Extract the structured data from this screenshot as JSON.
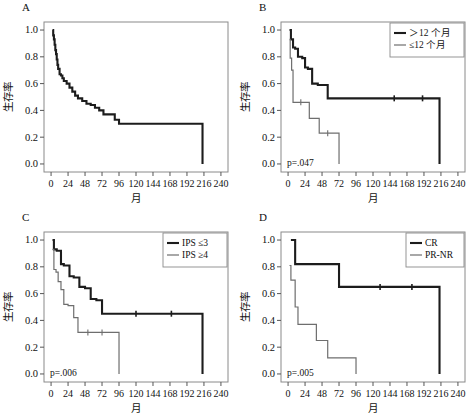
{
  "figure": {
    "axis": {
      "y_label": "生存率",
      "x_label": "月",
      "y_ticks": [
        "1.0",
        "0.8",
        "0.6",
        "0.4",
        "0.2",
        "0.0"
      ],
      "y_tick_values": [
        1.0,
        0.8,
        0.6,
        0.4,
        0.2,
        0.0
      ],
      "x_ticks": [
        "0",
        "24",
        "48",
        "72",
        "96",
        "120",
        "144",
        "168",
        "192",
        "216",
        "240"
      ],
      "x_tick_values": [
        0,
        24,
        48,
        72,
        96,
        120,
        144,
        168,
        192,
        216,
        240
      ],
      "xlim": [
        -10,
        250
      ],
      "ylim": [
        -0.06,
        1.06
      ],
      "grid": false
    },
    "colors": {
      "curve_thick": "#1c1c1c",
      "curve_thin": "#6e6e6e",
      "frame": "#8a8a8a",
      "text": "#111111",
      "background": "#ffffff"
    },
    "panels": [
      {
        "letter": "A",
        "pvalue": "",
        "legend": [],
        "legend_position": "none",
        "chart_data": {
          "type": "line",
          "title": "A",
          "xlabel": "月",
          "ylabel": "生存率",
          "xlim": [
            -10,
            250
          ],
          "ylim": [
            -0.06,
            1.06
          ],
          "grid": false,
          "series": [
            {
              "name": "overall",
              "style": "step-thick",
              "x": [
                2,
                3,
                4,
                5,
                6,
                7,
                8,
                9,
                10,
                12,
                14,
                16,
                18,
                22,
                26,
                30,
                34,
                38,
                44,
                50,
                56,
                62,
                68,
                74,
                82,
                90,
                96,
                214,
                214
              ],
              "y": [
                1.0,
                0.96,
                0.93,
                0.89,
                0.85,
                0.82,
                0.78,
                0.74,
                0.71,
                0.67,
                0.66,
                0.64,
                0.62,
                0.6,
                0.57,
                0.54,
                0.51,
                0.49,
                0.47,
                0.45,
                0.44,
                0.42,
                0.4,
                0.37,
                0.37,
                0.33,
                0.3,
                0.3,
                0.0
              ],
              "censors": []
            }
          ]
        }
      },
      {
        "letter": "B",
        "pvalue": "p=.047",
        "legend": [
          {
            "label": "＞12 个月",
            "style": "thick"
          },
          {
            "label": "≤12 个月",
            "style": "thin"
          }
        ],
        "legend_position": "top-right",
        "chart_data": {
          "type": "line",
          "title": "B",
          "xlabel": "月",
          "ylabel": "生存率",
          "xlim": [
            -10,
            250
          ],
          "ylim": [
            -0.06,
            1.06
          ],
          "grid": false,
          "series": [
            {
              "name": "＞12 个月",
              "style": "step-thick",
              "x": [
                2,
                4,
                7,
                10,
                14,
                20,
                24,
                28,
                34,
                42,
                56,
                214,
                214
              ],
              "y": [
                1.0,
                0.93,
                0.87,
                0.86,
                0.8,
                0.79,
                0.72,
                0.71,
                0.6,
                0.59,
                0.49,
                0.49,
                0.0
              ],
              "censors": [
                [
                  150,
                  0.49
                ],
                [
                  190,
                  0.49
                ]
              ]
            },
            {
              "name": "≤12 个月",
              "style": "step-thin",
              "x": [
                2,
                3,
                5,
                7,
                14,
                26,
                30,
                36,
                44,
                72,
                72
              ],
              "y": [
                0.93,
                0.79,
                0.7,
                0.46,
                0.46,
                0.46,
                0.34,
                0.34,
                0.23,
                0.23,
                0.0
              ],
              "censors": [
                [
                  18,
                  0.46
                ],
                [
                  56,
                  0.23
                ]
              ]
            }
          ]
        }
      },
      {
        "letter": "C",
        "pvalue": "p=.006",
        "legend": [
          {
            "label": "IPS ≤3",
            "style": "thick"
          },
          {
            "label": "IPS ≥4",
            "style": "thin"
          }
        ],
        "legend_position": "top-right",
        "chart_data": {
          "type": "line",
          "title": "C",
          "xlabel": "月",
          "ylabel": "生存率",
          "xlim": [
            -10,
            250
          ],
          "ylim": [
            -0.06,
            1.06
          ],
          "grid": false,
          "series": [
            {
              "name": "IPS ≤3",
              "style": "step-thick",
              "x": [
                2,
                4,
                8,
                14,
                18,
                26,
                32,
                40,
                48,
                56,
                64,
                72,
                214,
                214
              ],
              "y": [
                1.0,
                0.93,
                0.92,
                0.82,
                0.81,
                0.73,
                0.72,
                0.65,
                0.64,
                0.56,
                0.55,
                0.45,
                0.45,
                0.0
              ],
              "censors": [
                [
                  120,
                  0.45
                ],
                [
                  170,
                  0.45
                ]
              ]
            },
            {
              "name": "IPS ≥4",
              "style": "step-thin",
              "x": [
                2,
                4,
                7,
                10,
                14,
                18,
                24,
                32,
                38,
                96,
                96
              ],
              "y": [
                0.93,
                0.78,
                0.76,
                0.69,
                0.63,
                0.52,
                0.51,
                0.42,
                0.31,
                0.31,
                0.0
              ],
              "censors": [
                [
                  52,
                  0.31
                ],
                [
                  72,
                  0.31
                ]
              ]
            }
          ]
        }
      },
      {
        "letter": "D",
        "pvalue": "p=.005",
        "legend": [
          {
            "label": "CR",
            "style": "thick"
          },
          {
            "label": "PR-NR",
            "style": "thin"
          }
        ],
        "legend_position": "top-right",
        "chart_data": {
          "type": "line",
          "title": "D",
          "xlabel": "月",
          "ylabel": "生存率",
          "xlim": [
            -10,
            250
          ],
          "ylim": [
            -0.06,
            1.06
          ],
          "grid": false,
          "series": [
            {
              "name": "CR",
              "style": "step-thick",
              "x": [
                4,
                10,
                72,
                214,
                214
              ],
              "y": [
                1.0,
                0.82,
                0.65,
                0.65,
                0.0
              ],
              "censors": [
                [
                  130,
                  0.65
                ],
                [
                  175,
                  0.65
                ]
              ]
            },
            {
              "name": "PR-NR",
              "style": "step-thin",
              "x": [
                2,
                4,
                10,
                14,
                30,
                40,
                56,
                96,
                96
              ],
              "y": [
                0.81,
                0.7,
                0.5,
                0.37,
                0.37,
                0.25,
                0.12,
                0.12,
                0.0
              ],
              "censors": []
            }
          ]
        }
      }
    ]
  }
}
